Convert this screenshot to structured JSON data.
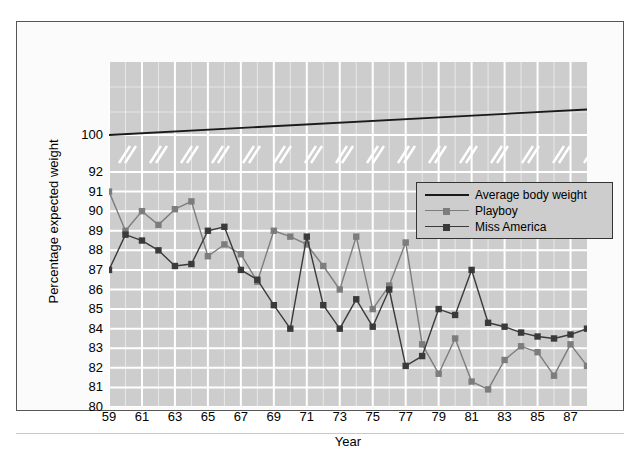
{
  "figure": {
    "y_axis_title": "Percentage expected weight",
    "x_axis_title": "Year"
  },
  "legend": {
    "items": [
      {
        "label": "Average body weight",
        "key": "average_body_weight",
        "color": "#1a1a1a",
        "marker": "none"
      },
      {
        "label": "Playboy",
        "key": "playboy",
        "color": "#7d7d7d",
        "marker": "square"
      },
      {
        "label": "Miss America",
        "key": "miss_america",
        "color": "#3a3a3a",
        "marker": "square"
      }
    ]
  },
  "colors": {
    "plot_background": "#cdcdcd",
    "gridline": "#ffffff",
    "figure_background": "#fbfbfb",
    "frame_border": "#555555",
    "average_body_weight": "#1a1a1a",
    "playboy": "#7d7d7d",
    "miss_america": "#3a3a3a",
    "text": "#000000"
  },
  "chart_data": {
    "type": "line",
    "title": "",
    "xlabel": "Year",
    "ylabel": "Percentage expected weight",
    "xlim": [
      59,
      88
    ],
    "ylim": [
      80,
      92
    ],
    "grid": true,
    "legend_position": "upper-right-inside",
    "axis_break": {
      "present": true,
      "between": [
        92,
        100
      ],
      "note": "Broken y-axis: white double-slash marks separate the 80-92 band from the 100 tick"
    },
    "y_ticks": [
      80,
      81,
      82,
      83,
      84,
      85,
      86,
      87,
      88,
      89,
      90,
      91,
      92,
      100
    ],
    "x_ticks": [
      59,
      61,
      63,
      65,
      67,
      69,
      71,
      73,
      75,
      77,
      79,
      81,
      83,
      85,
      87
    ],
    "x": [
      59,
      60,
      61,
      62,
      63,
      64,
      65,
      66,
      67,
      68,
      69,
      70,
      71,
      72,
      73,
      74,
      75,
      76,
      77,
      78,
      79,
      80,
      81,
      82,
      83,
      84,
      85,
      86,
      87,
      88
    ],
    "series": [
      {
        "name": "Average body weight",
        "key": "average_body_weight",
        "type": "trend-line",
        "marker": "none",
        "color": "#1a1a1a",
        "x": [
          59,
          88
        ],
        "values": [
          100,
          103.4
        ]
      },
      {
        "name": "Playboy",
        "key": "playboy",
        "type": "line-marker",
        "marker": "square",
        "color": "#7d7d7d",
        "x": [
          59,
          60,
          61,
          62,
          63,
          64,
          65,
          66,
          67,
          68,
          69,
          70,
          71,
          72,
          73,
          74,
          75,
          76,
          77,
          78,
          79,
          80,
          81,
          82,
          83,
          84,
          85,
          86,
          87,
          88
        ],
        "values": [
          91.0,
          89.0,
          90.0,
          89.3,
          90.1,
          90.5,
          87.7,
          88.3,
          87.8,
          86.4,
          89.0,
          88.7,
          88.3,
          87.2,
          86.0,
          88.7,
          85.0,
          86.2,
          88.4,
          83.2,
          81.7,
          83.5,
          81.3,
          80.9,
          82.4,
          83.1,
          82.8,
          81.6,
          83.2,
          82.1
        ]
      },
      {
        "name": "Miss America",
        "key": "miss_america",
        "type": "line-marker",
        "marker": "square",
        "color": "#3a3a3a",
        "x": [
          59,
          60,
          61,
          62,
          63,
          64,
          65,
          66,
          67,
          68,
          69,
          70,
          71,
          72,
          73,
          74,
          75,
          76,
          77,
          78,
          79,
          80,
          81,
          82,
          83,
          84,
          85,
          86,
          87,
          88
        ],
        "values": [
          87.0,
          88.8,
          88.5,
          88.0,
          87.2,
          87.3,
          89.0,
          89.2,
          87.0,
          86.5,
          85.2,
          84.0,
          88.7,
          85.2,
          84.0,
          85.5,
          84.1,
          86.0,
          82.1,
          82.6,
          85.0,
          84.7,
          87.0,
          84.3,
          84.1,
          83.8,
          83.6,
          83.5,
          83.7,
          84.0
        ]
      }
    ]
  }
}
